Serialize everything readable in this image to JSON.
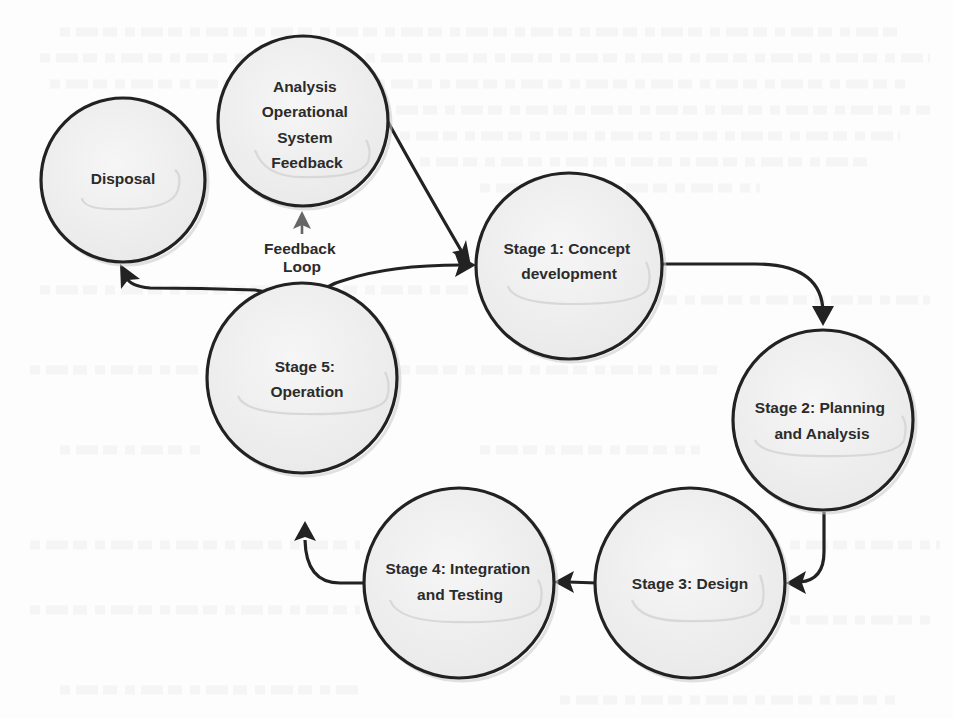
{
  "diagram": {
    "type": "cycle",
    "background": "#fdfdfd",
    "stroke_color": "#222222",
    "feedback_arrow_color": "#666666",
    "node_fill": "#f1f1f1",
    "nodes": [
      {
        "id": "disposal",
        "lines": [
          "Disposal"
        ],
        "cx": 123,
        "cy": 180,
        "r": 82
      },
      {
        "id": "analysis",
        "lines": [
          "Analysis",
          "Operational",
          "System",
          "Feedback"
        ],
        "cx": 303,
        "cy": 121,
        "r": 85
      },
      {
        "id": "stage1",
        "lines": [
          "Stage 1: Concept",
          "development"
        ],
        "cx": 569,
        "cy": 266,
        "r": 93
      },
      {
        "id": "stage2",
        "lines": [
          "Stage 2: Planning",
          "and Analysis"
        ],
        "cx": 823,
        "cy": 420,
        "r": 90
      },
      {
        "id": "stage3",
        "lines": [
          "Stage 3: Design"
        ],
        "cx": 690,
        "cy": 583,
        "r": 95
      },
      {
        "id": "stage4",
        "lines": [
          "Stage 4: Integration",
          "and Testing"
        ],
        "cx": 459,
        "cy": 583,
        "r": 95
      },
      {
        "id": "stage5",
        "lines": [
          "Stage 5:",
          "Operation"
        ],
        "cx": 302,
        "cy": 378,
        "r": 95
      }
    ],
    "edges": [
      {
        "from": "stage1",
        "to": "stage2"
      },
      {
        "from": "stage2",
        "to": "stage3"
      },
      {
        "from": "stage3",
        "to": "stage4"
      },
      {
        "from": "stage4",
        "to": "stage5"
      },
      {
        "from": "stage5",
        "to": "stage1"
      },
      {
        "from": "stage5",
        "to": "disposal"
      },
      {
        "from": "stage5",
        "to": "analysis",
        "label": "Feedback Loop"
      },
      {
        "from": "analysis",
        "to": "stage1"
      }
    ],
    "feedback_label": [
      "Feedback",
      "Loop"
    ]
  }
}
